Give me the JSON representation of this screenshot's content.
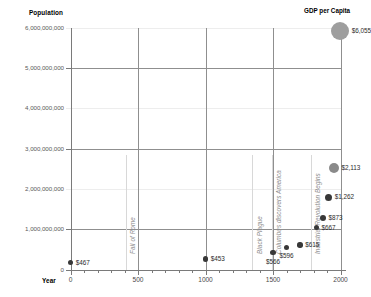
{
  "chart_data": {
    "type": "scatter",
    "title": "",
    "xlabel": "Year",
    "ylabel": "Population",
    "xlim": [
      0,
      2000
    ],
    "ylim": [
      0,
      6000000000
    ],
    "grid": true,
    "legend_position": "top-right",
    "legend_title": "GDP per Capita",
    "size_encoding": "GDP per Capita (US$)",
    "x_ticks": [
      "0",
      "500",
      "1000",
      "1500",
      "2000"
    ],
    "x_tick_values": [
      0,
      500,
      1000,
      1500,
      2000
    ],
    "y_ticks": [
      "0",
      "1,000,000,000",
      "2,000,000,000",
      "3,000,000,000",
      "4,000,000,000",
      "5,000,000,000",
      "6,000,000,000"
    ],
    "y_tick_values": [
      0,
      1000000000,
      2000000000,
      3000000000,
      4000000000,
      5000000000,
      6000000000
    ],
    "points": [
      {
        "year": 1,
        "population": 170000000,
        "gdp_per_capita": 467,
        "label": "$467"
      },
      {
        "year": 1000,
        "population": 265000000,
        "gdp_per_capita": 453,
        "label": "$453"
      },
      {
        "year": 1500,
        "population": 425000000,
        "gdp_per_capita": 566,
        "label": "$566"
      },
      {
        "year": 1600,
        "population": 545000000,
        "gdp_per_capita": 596,
        "label": "$596"
      },
      {
        "year": 1700,
        "population": 610000000,
        "gdp_per_capita": 615,
        "label": "$615"
      },
      {
        "year": 1820,
        "population": 1040000000,
        "gdp_per_capita": 667,
        "label": "$667"
      },
      {
        "year": 1870,
        "population": 1270000000,
        "gdp_per_capita": 873,
        "label": "$873"
      },
      {
        "year": 1913,
        "population": 1790000000,
        "gdp_per_capita": 1262,
        "label": "$1,262"
      },
      {
        "year": 1950,
        "population": 2520000000,
        "gdp_per_capita": 2113,
        "label": "$2,113"
      },
      {
        "year": 1998,
        "population": 5910000000,
        "gdp_per_capita": 6055,
        "label": "$6,055"
      }
    ],
    "annotations": [
      {
        "text": "Fall of Rome",
        "year": 410
      },
      {
        "text": "Black Plague",
        "year": 1348
      },
      {
        "text": "Columbus discovers America",
        "year": 1492
      },
      {
        "text": "Industrial Revolution Begins",
        "year": 1780
      }
    ],
    "colors": {
      "point_dark": "#383838",
      "point_mid": "#8a8a8a",
      "point_large": "#9e9e9e",
      "gridline_major": "#8f8f8f",
      "gridline_minor": "#ededed",
      "axis": "#7a7a7a",
      "annotation": "#8e8e8e",
      "tick_label": "#5a5a5a"
    }
  }
}
